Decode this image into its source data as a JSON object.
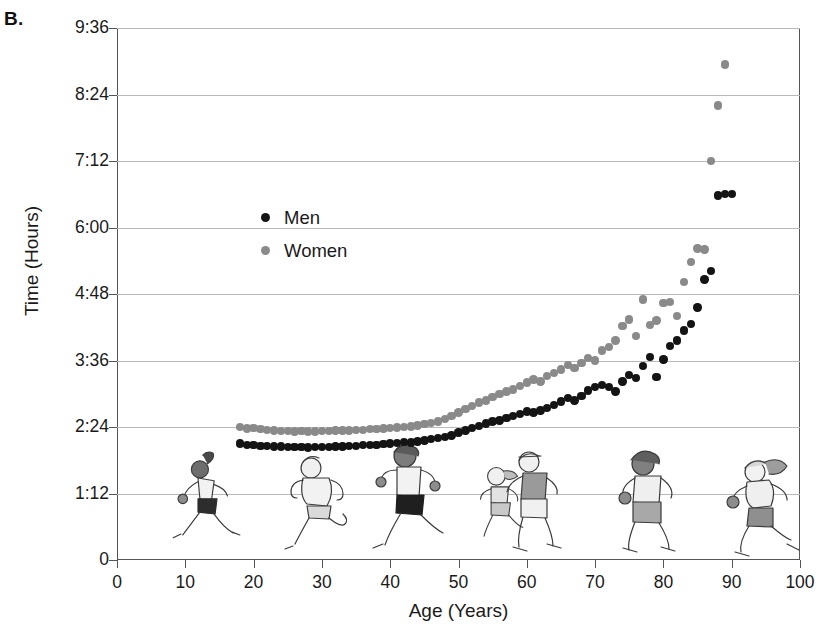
{
  "figure": {
    "panel_label": "B.",
    "legend": [
      {
        "label": "Men",
        "color": "#141414",
        "key": "men"
      },
      {
        "label": "Women",
        "color": "#8a8a8a",
        "key": "women"
      }
    ]
  },
  "chart_data": {
    "type": "scatter",
    "title": "",
    "xlabel": "Age (Years)",
    "ylabel": "Time (Hours)",
    "xlim": [
      0,
      100
    ],
    "ylim": [
      0,
      9.6
    ],
    "xticks": [
      0,
      10,
      20,
      30,
      40,
      50,
      60,
      70,
      80,
      90,
      100
    ],
    "xticklabels": [
      "0",
      "10",
      "20",
      "30",
      "40",
      "50",
      "60",
      "70",
      "80",
      "90",
      "100"
    ],
    "yticks": [
      0,
      1.2,
      2.4,
      3.6,
      4.8,
      6.0,
      7.2,
      8.4,
      9.6
    ],
    "yticklabels": [
      "0",
      "1:12",
      "2:24",
      "3:36",
      "4:48",
      "6:00",
      "7:12",
      "8:24",
      "9:36"
    ],
    "grid": "horizontal",
    "legend_position": "upper-left-inside",
    "y_unit": "hours (h:mm marathon finish time)",
    "series": [
      {
        "name": "Men",
        "color": "#141414",
        "points": [
          [
            18,
            2.1
          ],
          [
            19,
            2.08
          ],
          [
            20,
            2.07
          ],
          [
            21,
            2.06
          ],
          [
            22,
            2.06
          ],
          [
            23,
            2.05
          ],
          [
            24,
            2.05
          ],
          [
            25,
            2.04
          ],
          [
            26,
            2.04
          ],
          [
            27,
            2.04
          ],
          [
            28,
            2.03
          ],
          [
            29,
            2.04
          ],
          [
            30,
            2.04
          ],
          [
            31,
            2.04
          ],
          [
            32,
            2.05
          ],
          [
            33,
            2.05
          ],
          [
            34,
            2.06
          ],
          [
            35,
            2.06
          ],
          [
            36,
            2.07
          ],
          [
            37,
            2.07
          ],
          [
            38,
            2.08
          ],
          [
            39,
            2.09
          ],
          [
            40,
            2.1
          ],
          [
            41,
            2.11
          ],
          [
            42,
            2.13
          ],
          [
            43,
            2.12
          ],
          [
            44,
            2.14
          ],
          [
            45,
            2.16
          ],
          [
            46,
            2.18
          ],
          [
            47,
            2.2
          ],
          [
            48,
            2.22
          ],
          [
            49,
            2.25
          ],
          [
            50,
            2.3
          ],
          [
            51,
            2.34
          ],
          [
            52,
            2.38
          ],
          [
            53,
            2.42
          ],
          [
            54,
            2.46
          ],
          [
            55,
            2.5
          ],
          [
            56,
            2.52
          ],
          [
            57,
            2.56
          ],
          [
            58,
            2.6
          ],
          [
            59,
            2.64
          ],
          [
            60,
            2.68
          ],
          [
            61,
            2.66
          ],
          [
            62,
            2.7
          ],
          [
            63,
            2.74
          ],
          [
            64,
            2.8
          ],
          [
            65,
            2.86
          ],
          [
            66,
            2.92
          ],
          [
            67,
            2.88
          ],
          [
            68,
            2.96
          ],
          [
            69,
            3.06
          ],
          [
            70,
            3.12
          ],
          [
            71,
            3.16
          ],
          [
            72,
            3.12
          ],
          [
            73,
            3.04
          ],
          [
            74,
            3.22
          ],
          [
            75,
            3.34
          ],
          [
            76,
            3.28
          ],
          [
            77,
            3.5
          ],
          [
            78,
            3.66
          ],
          [
            79,
            3.3
          ],
          [
            80,
            3.62
          ],
          [
            81,
            3.86
          ],
          [
            82,
            3.96
          ],
          [
            83,
            4.14
          ],
          [
            84,
            4.26
          ],
          [
            85,
            4.56
          ],
          [
            86,
            5.06
          ],
          [
            87,
            5.22
          ],
          [
            88,
            6.58
          ],
          [
            89,
            6.6
          ],
          [
            90,
            6.6
          ]
        ]
      },
      {
        "name": "Women",
        "color": "#8a8a8a",
        "points": [
          [
            18,
            2.4
          ],
          [
            19,
            2.37
          ],
          [
            20,
            2.38
          ],
          [
            21,
            2.36
          ],
          [
            22,
            2.35
          ],
          [
            23,
            2.34
          ],
          [
            24,
            2.33
          ],
          [
            25,
            2.33
          ],
          [
            26,
            2.32
          ],
          [
            27,
            2.33
          ],
          [
            28,
            2.32
          ],
          [
            29,
            2.32
          ],
          [
            30,
            2.33
          ],
          [
            31,
            2.33
          ],
          [
            32,
            2.34
          ],
          [
            33,
            2.34
          ],
          [
            34,
            2.34
          ],
          [
            35,
            2.35
          ],
          [
            36,
            2.35
          ],
          [
            37,
            2.36
          ],
          [
            38,
            2.36
          ],
          [
            39,
            2.37
          ],
          [
            40,
            2.38
          ],
          [
            41,
            2.39
          ],
          [
            42,
            2.4
          ],
          [
            43,
            2.41
          ],
          [
            44,
            2.43
          ],
          [
            45,
            2.45
          ],
          [
            46,
            2.47
          ],
          [
            47,
            2.5
          ],
          [
            48,
            2.54
          ],
          [
            49,
            2.6
          ],
          [
            50,
            2.66
          ],
          [
            51,
            2.72
          ],
          [
            52,
            2.78
          ],
          [
            53,
            2.84
          ],
          [
            54,
            2.88
          ],
          [
            55,
            2.94
          ],
          [
            56,
            3.0
          ],
          [
            57,
            3.04
          ],
          [
            58,
            3.08
          ],
          [
            59,
            3.14
          ],
          [
            60,
            3.2
          ],
          [
            61,
            3.26
          ],
          [
            62,
            3.22
          ],
          [
            63,
            3.32
          ],
          [
            64,
            3.38
          ],
          [
            65,
            3.44
          ],
          [
            66,
            3.52
          ],
          [
            67,
            3.46
          ],
          [
            68,
            3.56
          ],
          [
            69,
            3.64
          ],
          [
            70,
            3.6
          ],
          [
            71,
            3.78
          ],
          [
            72,
            3.84
          ],
          [
            73,
            3.96
          ],
          [
            74,
            4.22
          ],
          [
            75,
            4.34
          ],
          [
            76,
            4.04
          ],
          [
            77,
            4.7
          ],
          [
            78,
            4.24
          ],
          [
            79,
            4.32
          ],
          [
            80,
            4.64
          ],
          [
            81,
            4.66
          ],
          [
            82,
            4.4
          ],
          [
            83,
            5.02
          ],
          [
            84,
            5.38
          ],
          [
            85,
            5.62
          ],
          [
            86,
            5.6
          ],
          [
            87,
            7.2
          ],
          [
            88,
            8.2
          ],
          [
            89,
            8.94
          ]
        ]
      }
    ],
    "decorations": {
      "runner_illustrations": 7,
      "note": "cartoon runner figures spanning ages ~20 to ~90 along the lower plot area"
    }
  }
}
